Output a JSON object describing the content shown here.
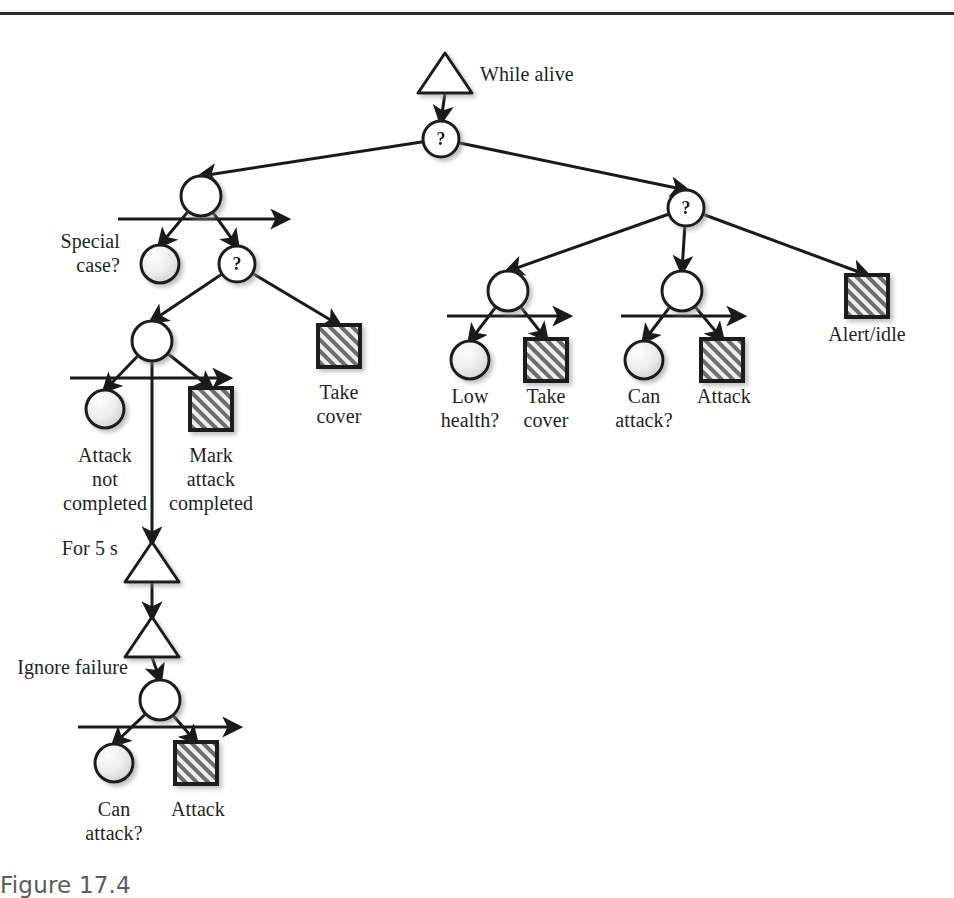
{
  "figure": {
    "caption": "Figure 17.4",
    "top_rule": true,
    "width": 954,
    "height": 896
  },
  "colors": {
    "stroke": "#1a1a1a",
    "action_fill": "#e8e8e8",
    "action_hatch": "#4a4a4a",
    "condition_fill_light": "#f7f7f7",
    "condition_fill_dark": "#d8d8d8",
    "shadow": "#b9b9b9",
    "background": "#ffffff",
    "text": "#1f1f1f",
    "caption": "#5b5b5b"
  },
  "legend": {
    "triangle_meaning": "decorator",
    "circle_plain_meaning": "sequence",
    "circle_question_meaning": "selector",
    "circle_shaded_meaning": "condition",
    "square_hatched_meaning": "action"
  },
  "nodes": [
    {
      "id": "n_root_decorator",
      "type": "decorator",
      "label": "While alive",
      "x": 445,
      "y": 73,
      "label_x": 480,
      "label_y": 62,
      "label_align": "left"
    },
    {
      "id": "n_root_selector",
      "type": "selector",
      "label": "?",
      "x": 441,
      "y": 139,
      "label_x": 441,
      "label_y": 139,
      "label_align": "center"
    },
    {
      "id": "n_left_sequence",
      "type": "sequence",
      "label": "",
      "x": 201,
      "y": 196,
      "label_x": 201,
      "label_y": 196,
      "label_align": "center"
    },
    {
      "id": "n_special_case",
      "type": "condition",
      "label": "Special\ncase?",
      "x": 160,
      "y": 264,
      "label_x": 120,
      "label_y": 229,
      "label_align": "right"
    },
    {
      "id": "n_left_selector",
      "type": "selector",
      "label": "?",
      "x": 237,
      "y": 264,
      "label_x": 237,
      "label_y": 264,
      "label_align": "center"
    },
    {
      "id": "n_attack_sequence",
      "type": "sequence",
      "label": "",
      "x": 152,
      "y": 341,
      "label_x": 152,
      "label_y": 341,
      "label_align": "center"
    },
    {
      "id": "n_take_cover_1",
      "type": "action",
      "label": "Take\ncover",
      "x": 339,
      "y": 346,
      "label_x": 339,
      "label_y": 380,
      "label_align": "center"
    },
    {
      "id": "n_attack_not_done",
      "type": "condition",
      "label": "Attack\nnot\ncompleted",
      "x": 105,
      "y": 409,
      "label_x": 105,
      "label_y": 443,
      "label_align": "center"
    },
    {
      "id": "n_mark_attack",
      "type": "action",
      "label": "Mark\nattack\ncompleted",
      "x": 211,
      "y": 409,
      "label_x": 211,
      "label_y": 443,
      "label_align": "center"
    },
    {
      "id": "n_for_5s",
      "type": "decorator",
      "label": "For 5 s",
      "x": 152,
      "y": 562,
      "label_x": 118,
      "label_y": 536,
      "label_align": "right"
    },
    {
      "id": "n_ignore_failure",
      "type": "decorator",
      "label": "Ignore failure",
      "x": 152,
      "y": 637,
      "label_x": 128,
      "label_y": 655,
      "label_align": "right"
    },
    {
      "id": "n_bottom_sequence",
      "type": "sequence",
      "label": "",
      "x": 160,
      "y": 700,
      "label_x": 160,
      "label_y": 700,
      "label_align": "center"
    },
    {
      "id": "n_can_attack_2",
      "type": "condition",
      "label": "Can\nattack?",
      "x": 114,
      "y": 763,
      "label_x": 114,
      "label_y": 797,
      "label_align": "center"
    },
    {
      "id": "n_attack_2",
      "type": "action",
      "label": "Attack",
      "x": 196,
      "y": 763,
      "label_x": 198,
      "label_y": 797,
      "label_align": "center"
    },
    {
      "id": "n_right_selector",
      "type": "selector",
      "label": "?",
      "x": 686,
      "y": 208,
      "label_x": 686,
      "label_y": 208,
      "label_align": "center"
    },
    {
      "id": "n_health_sequence",
      "type": "sequence",
      "label": "",
      "x": 508,
      "y": 291,
      "label_x": 508,
      "label_y": 291,
      "label_align": "center"
    },
    {
      "id": "n_atk_sequence_r",
      "type": "sequence",
      "label": "",
      "x": 682,
      "y": 291,
      "label_x": 682,
      "label_y": 291,
      "label_align": "center"
    },
    {
      "id": "n_alert_idle",
      "type": "action",
      "label": "Alert/idle",
      "x": 867,
      "y": 296,
      "label_x": 867,
      "label_y": 322,
      "label_align": "center"
    },
    {
      "id": "n_low_health",
      "type": "condition",
      "label": "Low\nhealth?",
      "x": 470,
      "y": 360,
      "label_x": 470,
      "label_y": 384,
      "label_align": "center"
    },
    {
      "id": "n_take_cover_2",
      "type": "action",
      "label": "Take\ncover",
      "x": 546,
      "y": 360,
      "label_x": 546,
      "label_y": 384,
      "label_align": "center"
    },
    {
      "id": "n_can_attack_1",
      "type": "condition",
      "label": "Can\nattack?",
      "x": 644,
      "y": 360,
      "label_x": 644,
      "label_y": 384,
      "label_align": "center"
    },
    {
      "id": "n_attack_1",
      "type": "action",
      "label": "Attack",
      "x": 722,
      "y": 360,
      "label_x": 724,
      "label_y": 384,
      "label_align": "center"
    }
  ],
  "edges": [
    {
      "from": "n_root_decorator",
      "to": "n_root_selector"
    },
    {
      "from": "n_root_selector",
      "to": "n_left_sequence"
    },
    {
      "from": "n_root_selector",
      "to": "n_right_selector"
    },
    {
      "from": "n_left_sequence",
      "to": "n_special_case"
    },
    {
      "from": "n_left_sequence",
      "to": "n_left_selector"
    },
    {
      "from": "n_left_selector",
      "to": "n_attack_sequence"
    },
    {
      "from": "n_left_selector",
      "to": "n_take_cover_1"
    },
    {
      "from": "n_attack_sequence",
      "to": "n_attack_not_done"
    },
    {
      "from": "n_attack_sequence",
      "to": "n_for_5s"
    },
    {
      "from": "n_attack_sequence",
      "to": "n_mark_attack"
    },
    {
      "from": "n_for_5s",
      "to": "n_ignore_failure"
    },
    {
      "from": "n_ignore_failure",
      "to": "n_bottom_sequence"
    },
    {
      "from": "n_bottom_sequence",
      "to": "n_can_attack_2"
    },
    {
      "from": "n_bottom_sequence",
      "to": "n_attack_2"
    },
    {
      "from": "n_right_selector",
      "to": "n_health_sequence"
    },
    {
      "from": "n_right_selector",
      "to": "n_atk_sequence_r"
    },
    {
      "from": "n_right_selector",
      "to": "n_alert_idle"
    },
    {
      "from": "n_health_sequence",
      "to": "n_low_health"
    },
    {
      "from": "n_health_sequence",
      "to": "n_take_cover_2"
    },
    {
      "from": "n_atk_sequence_r",
      "to": "n_can_attack_1"
    },
    {
      "from": "n_atk_sequence_r",
      "to": "n_attack_1"
    }
  ],
  "sequence_bars": [
    {
      "id": "bar_left",
      "cx": 201,
      "y": 219,
      "x1": 118,
      "x2": 286
    },
    {
      "id": "bar_attack",
      "cx": 152,
      "y": 378,
      "x1": 70,
      "x2": 228
    },
    {
      "id": "bar_bottom",
      "cx": 160,
      "y": 727,
      "x1": 78,
      "x2": 238
    },
    {
      "id": "bar_health",
      "cx": 508,
      "y": 316,
      "x1": 447,
      "x2": 568
    },
    {
      "id": "bar_atk_right",
      "cx": 682,
      "y": 316,
      "x1": 621,
      "x2": 742
    }
  ]
}
